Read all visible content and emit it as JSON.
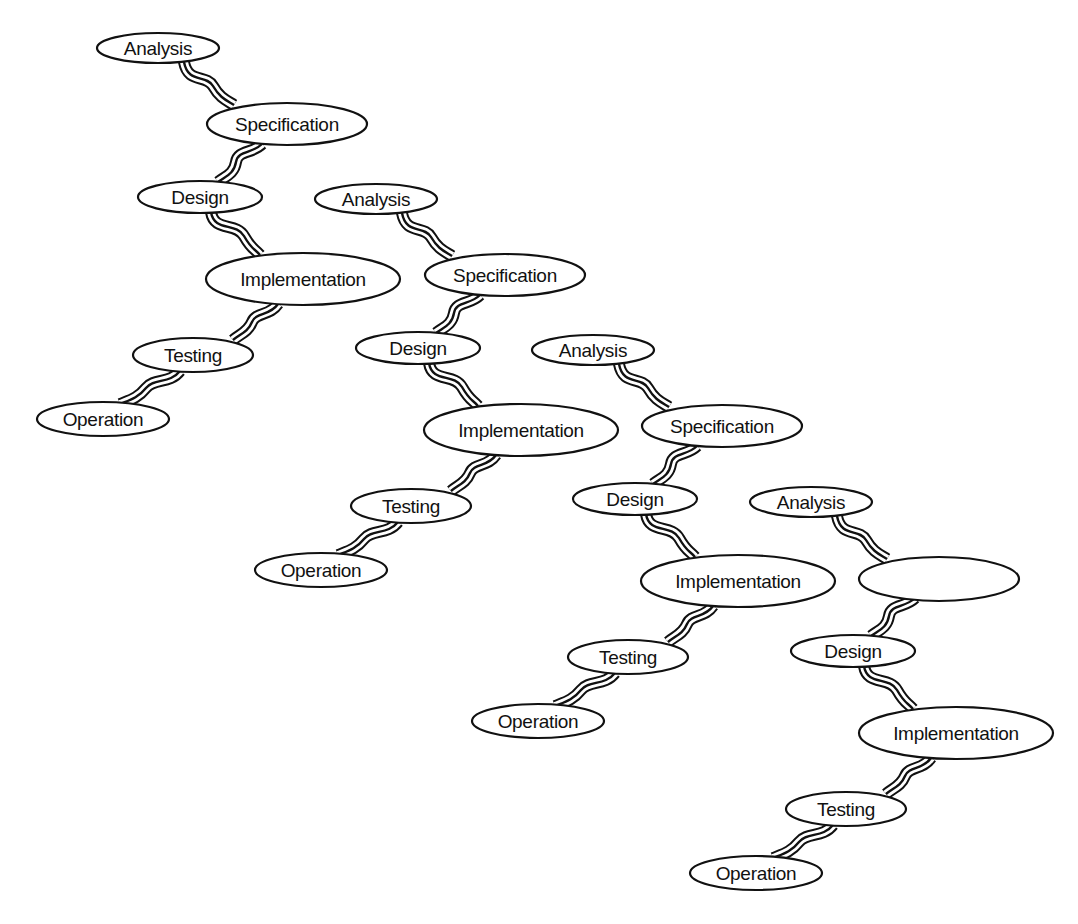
{
  "diagram": {
    "type": "staggered-waterfall-process-chains",
    "chain_count": 4,
    "colors": {
      "background": "#ffffff",
      "stroke": "#111111",
      "text": "#111111"
    },
    "connector_style": "triple-line-wavy",
    "chains": [
      {
        "id": "chain-1",
        "offset": [
          0,
          0
        ],
        "stages": [
          {
            "label": "Analysis"
          },
          {
            "label": "Specification"
          },
          {
            "label": "Design"
          },
          {
            "label": "Implementation"
          },
          {
            "label": "Testing"
          },
          {
            "label": "Operation"
          }
        ]
      },
      {
        "id": "chain-2",
        "offset": [
          218,
          151
        ],
        "stages": [
          {
            "label": "Analysis"
          },
          {
            "label": "Specification"
          },
          {
            "label": "Design"
          },
          {
            "label": "Implementation"
          },
          {
            "label": "Testing"
          },
          {
            "label": "Operation"
          }
        ]
      },
      {
        "id": "chain-3",
        "offset": [
          435,
          302
        ],
        "stages": [
          {
            "label": "Analysis"
          },
          {
            "label": "Specification"
          },
          {
            "label": "Design"
          },
          {
            "label": "Implementation"
          },
          {
            "label": "Testing"
          },
          {
            "label": "Operation"
          }
        ]
      },
      {
        "id": "chain-4",
        "offset": [
          653,
          454
        ],
        "stages": [
          {
            "label": "Analysis"
          },
          {
            "label": ""
          },
          {
            "label": "Design"
          },
          {
            "label": "Implementation"
          },
          {
            "label": "Testing"
          },
          {
            "label": "Operation"
          }
        ]
      }
    ]
  }
}
